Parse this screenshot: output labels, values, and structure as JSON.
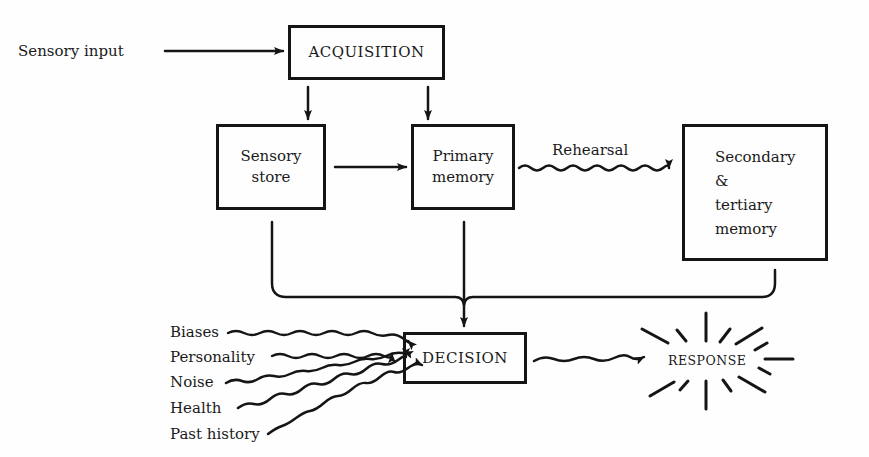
{
  "diagram": {
    "nodes": {
      "acquisition": "ACQUISITION",
      "sensory_store": "Sensory\nstore",
      "primary_memory": "Primary\nmemory",
      "secondary_memory": "Secondary\n&\ntertiary\nmemory",
      "decision": "DECISION",
      "response": "RESPONSE"
    },
    "inputs": {
      "sensory_input": "Sensory input"
    },
    "edge_labels": {
      "rehearsal": "Rehearsal"
    },
    "decision_factors": [
      "Biases",
      "Personality",
      "Noise",
      "Health",
      "Past history"
    ],
    "edges": [
      {
        "from": "Sensory input",
        "to": "ACQUISITION",
        "style": "straight"
      },
      {
        "from": "ACQUISITION",
        "to": "Sensory store",
        "style": "straight"
      },
      {
        "from": "ACQUISITION",
        "to": "Primary memory",
        "style": "straight"
      },
      {
        "from": "Sensory store",
        "to": "Primary memory",
        "style": "straight"
      },
      {
        "from": "Primary memory",
        "to": "Secondary & tertiary memory",
        "style": "wavy",
        "label": "Rehearsal"
      },
      {
        "from": "Sensory store",
        "to": "DECISION",
        "style": "bracket"
      },
      {
        "from": "Primary memory",
        "to": "DECISION",
        "style": "bracket"
      },
      {
        "from": "Secondary & tertiary memory",
        "to": "DECISION",
        "style": "bracket"
      },
      {
        "from": "Biases",
        "to": "DECISION",
        "style": "wavy"
      },
      {
        "from": "Personality",
        "to": "DECISION",
        "style": "wavy"
      },
      {
        "from": "Noise",
        "to": "DECISION",
        "style": "wavy"
      },
      {
        "from": "Health",
        "to": "DECISION",
        "style": "wavy"
      },
      {
        "from": "Past history",
        "to": "DECISION",
        "style": "wavy"
      },
      {
        "from": "DECISION",
        "to": "RESPONSE",
        "style": "wavy"
      }
    ]
  }
}
